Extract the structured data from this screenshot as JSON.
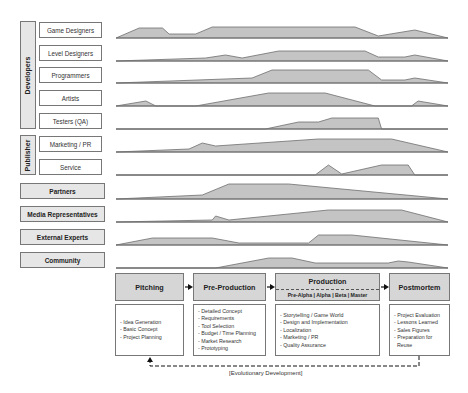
{
  "groups": {
    "developers": "Developers",
    "publisher": "Publisher"
  },
  "roles": [
    {
      "label": "Game Designers"
    },
    {
      "label": "Level Designers"
    },
    {
      "label": "Programmers"
    },
    {
      "label": "Artists"
    },
    {
      "label": "Testers (QA)"
    },
    {
      "label": "Marketing / PR"
    },
    {
      "label": "Service"
    }
  ],
  "stakeholders": [
    {
      "label": "Partners"
    },
    {
      "label": "Media Representatives"
    },
    {
      "label": "External Experts"
    },
    {
      "label": "Community"
    }
  ],
  "phases": [
    {
      "label": "Pitching",
      "details": [
        "- Idea Generation",
        "- Basic Concept",
        "- Project Planning"
      ]
    },
    {
      "label": "Pre-Production",
      "details": [
        "- Detailed Concept",
        "- Requirements",
        "- Tool Selection",
        "- Budget / Time Planning",
        "- Market Research",
        "- Prototyping"
      ]
    },
    {
      "label": "Production",
      "sublabel": "Pre-Alpha | Alpha | Beta | Master",
      "details": [
        "- Storytelling / Game World",
        "- Design and Implementation",
        "- Localization",
        "- Marketing / PR",
        "- Quality Assurance"
      ]
    },
    {
      "label": "Postmortem",
      "details": [
        "- Project Evaluation",
        "- Lessons Learned",
        "- Sales Figures",
        "- Preparation for",
        "  Reuse"
      ]
    }
  ],
  "feedback_loop": {
    "label": "[Evolutionary Development]"
  },
  "colors": {
    "area_fill": "#c4c4c4",
    "area_stroke": "#6e6e6e",
    "phase_fill": "#d6d6d6",
    "label_fill": "#e6e6e6"
  },
  "chart_data": {
    "type": "area",
    "x": "relative project time (0 = start of Pitching, 100 = end of Postmortem)",
    "series": [
      {
        "name": "Game Designers",
        "points": [
          [
            0,
            0
          ],
          [
            7,
            10
          ],
          [
            14,
            10
          ],
          [
            16,
            4
          ],
          [
            24,
            4
          ],
          [
            29,
            11
          ],
          [
            72,
            11
          ],
          [
            79,
            2
          ],
          [
            90,
            8
          ],
          [
            100,
            0
          ]
        ]
      },
      {
        "name": "Level Designers",
        "points": [
          [
            0,
            0
          ],
          [
            27,
            3
          ],
          [
            33,
            6
          ],
          [
            38,
            3
          ],
          [
            49,
            10
          ],
          [
            75,
            10
          ],
          [
            79,
            4
          ],
          [
            87,
            4
          ],
          [
            90,
            6
          ],
          [
            100,
            0
          ]
        ]
      },
      {
        "name": "Programmers",
        "points": [
          [
            0,
            0
          ],
          [
            41,
            5
          ],
          [
            47,
            13
          ],
          [
            76,
            13
          ],
          [
            80,
            3
          ],
          [
            87,
            3
          ],
          [
            90,
            5
          ],
          [
            100,
            0
          ]
        ]
      },
      {
        "name": "Artists",
        "points": [
          [
            0,
            0
          ],
          [
            9,
            5
          ],
          [
            12,
            0
          ],
          [
            24,
            0
          ],
          [
            46,
            13
          ],
          [
            63,
            13
          ],
          [
            78,
            0
          ],
          [
            89,
            0
          ],
          [
            91,
            5
          ],
          [
            100,
            0
          ]
        ]
      },
      {
        "name": "Testers (QA)",
        "points": [
          [
            0,
            0
          ],
          [
            45,
            0
          ],
          [
            55,
            7
          ],
          [
            61,
            7
          ],
          [
            65,
            11
          ],
          [
            79,
            11
          ],
          [
            80,
            0
          ],
          [
            100,
            0
          ]
        ]
      },
      {
        "name": "Marketing / PR",
        "points": [
          [
            0,
            0
          ],
          [
            22,
            3
          ],
          [
            26,
            9
          ],
          [
            30,
            6
          ],
          [
            61,
            13
          ],
          [
            83,
            13
          ],
          [
            100,
            0
          ]
        ]
      },
      {
        "name": "Service",
        "points": [
          [
            0,
            0
          ],
          [
            60,
            0
          ],
          [
            64,
            10
          ],
          [
            68,
            1
          ],
          [
            80,
            10
          ],
          [
            88,
            10
          ],
          [
            90,
            0
          ],
          [
            100,
            0
          ]
        ]
      },
      {
        "name": "Partners",
        "points": [
          [
            0,
            0
          ],
          [
            26,
            4
          ],
          [
            34,
            15
          ],
          [
            52,
            15
          ],
          [
            100,
            0
          ]
        ]
      },
      {
        "name": "Media Representatives",
        "points": [
          [
            0,
            0
          ],
          [
            29,
            2
          ],
          [
            30,
            6
          ],
          [
            34,
            2
          ],
          [
            64,
            12
          ],
          [
            86,
            12
          ],
          [
            100,
            0
          ]
        ]
      },
      {
        "name": "External Experts",
        "points": [
          [
            0,
            0
          ],
          [
            11,
            7
          ],
          [
            29,
            7
          ],
          [
            37,
            2
          ],
          [
            58,
            2
          ],
          [
            61,
            10
          ],
          [
            71,
            10
          ],
          [
            100,
            0
          ]
        ]
      },
      {
        "name": "Community",
        "points": [
          [
            0,
            0
          ],
          [
            30,
            0
          ],
          [
            46,
            10
          ],
          [
            53,
            10
          ],
          [
            60,
            5
          ],
          [
            82,
            5
          ],
          [
            85,
            7
          ],
          [
            88,
            6
          ],
          [
            100,
            0
          ]
        ]
      }
    ],
    "phase_boundaries": [
      "Pitching",
      "Pre-Production",
      "Production",
      "Postmortem"
    ],
    "legend": "none",
    "grid": false
  }
}
